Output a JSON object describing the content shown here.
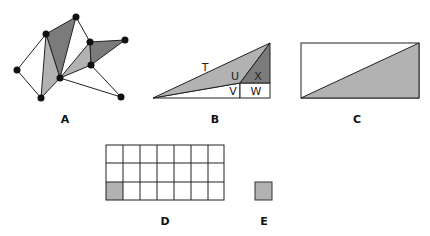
{
  "colors": {
    "dark": "#7b7b7b",
    "light": "#b2b2b2",
    "stroke": "#222222",
    "white": "#ffffff"
  },
  "figures": {
    "A": {
      "label": "A",
      "vertices": [
        [
          46,
          34
        ],
        [
          76,
          17
        ],
        [
          60,
          78
        ],
        [
          41,
          98
        ],
        [
          17,
          70
        ],
        [
          90,
          42
        ],
        [
          125,
          40
        ],
        [
          91,
          65
        ],
        [
          121,
          97
        ]
      ],
      "dark_triangles": [
        [
          [
            46,
            34
          ],
          [
            76,
            17
          ],
          [
            60,
            78
          ]
        ],
        [
          [
            90,
            42
          ],
          [
            125,
            40
          ],
          [
            91,
            65
          ]
        ]
      ],
      "light_triangles": [
        [
          [
            46,
            34
          ],
          [
            60,
            78
          ],
          [
            41,
            98
          ]
        ],
        [
          [
            60,
            78
          ],
          [
            90,
            42
          ],
          [
            91,
            65
          ]
        ]
      ]
    },
    "B": {
      "label": "B",
      "regions": [
        "T",
        "U",
        "V",
        "W",
        "X"
      ]
    },
    "C": {
      "label": "C"
    },
    "D": {
      "label": "D",
      "columns": 7,
      "rows": 3,
      "shaded_cell": "bottom-left"
    },
    "E": {
      "label": "E"
    }
  }
}
